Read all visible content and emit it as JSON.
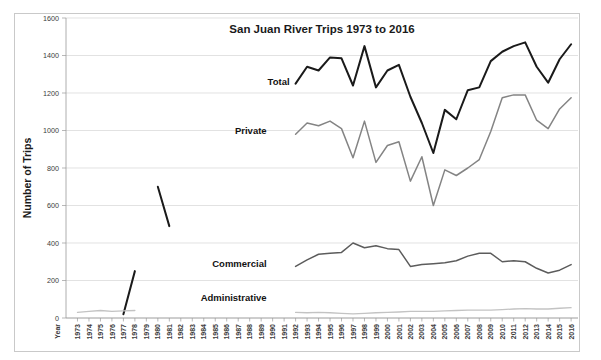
{
  "figure": {
    "title": "San Juan River Trips 1973 to 2016",
    "y_axis_title": "Number of Trips",
    "x_axis_corner_label": "Year"
  },
  "colors": {
    "total": "#1a1a1a",
    "private": "#848484",
    "commercial": "#5c5c5c",
    "administrative": "#c3c3c3",
    "grid": "#d6d6d6",
    "axis": "#9a9a9a",
    "frame": "#c9c9c9",
    "background": "#ffffff"
  },
  "series_labels": {
    "total": "Total",
    "private": "Private",
    "commercial": "Commercial",
    "administrative": "Administrative"
  },
  "chart_data": {
    "type": "line",
    "title": "San Juan River Trips 1973 to 2016",
    "xlabel": "Year",
    "ylabel": "Number of Trips",
    "ylim": [
      0,
      1600
    ],
    "ytick_labels": [
      "0",
      "200",
      "400",
      "600",
      "800",
      "1000",
      "1200",
      "1400",
      "1600"
    ],
    "yticks": [
      0,
      200,
      400,
      600,
      800,
      1000,
      1200,
      1400,
      1600
    ],
    "grid": true,
    "legend": "inline-labels",
    "categories": [
      "1973",
      "1974",
      "1975",
      "1976",
      "1977",
      "1978",
      "1979",
      "1980",
      "1981",
      "1982",
      "1983",
      "1984",
      "1985",
      "1986",
      "1987",
      "1988",
      "1989",
      "1990",
      "1991",
      "1992",
      "1993",
      "1994",
      "1995",
      "1996",
      "1997",
      "1998",
      "1999",
      "2000",
      "2001",
      "2002",
      "2003",
      "2004",
      "2005",
      "2006",
      "2007",
      "2008",
      "2009",
      "2010",
      "2011",
      "2012",
      "2013",
      "2014",
      "2015",
      "2016"
    ],
    "series": [
      {
        "name": "Total",
        "color": "#1a1a1a",
        "values": [
          null,
          null,
          null,
          null,
          20,
          250,
          null,
          700,
          490,
          null,
          null,
          null,
          null,
          null,
          null,
          null,
          null,
          null,
          null,
          1250,
          1340,
          1320,
          1390,
          1385,
          1240,
          1450,
          1230,
          1320,
          1350,
          1180,
          1040,
          880,
          1110,
          1060,
          1215,
          1230,
          1370,
          1420,
          1450,
          1470,
          1340,
          1255,
          1380,
          1460
        ]
      },
      {
        "name": "Private",
        "color": "#848484",
        "values": [
          null,
          null,
          null,
          null,
          null,
          null,
          null,
          null,
          null,
          null,
          null,
          null,
          null,
          null,
          null,
          null,
          null,
          null,
          null,
          980,
          1040,
          1025,
          1050,
          1010,
          855,
          1050,
          830,
          920,
          940,
          730,
          860,
          600,
          790,
          760,
          800,
          845,
          995,
          1175,
          1190,
          1190,
          1055,
          1010,
          1115,
          1175
        ]
      },
      {
        "name": "Commercial",
        "color": "#5c5c5c",
        "values": [
          null,
          null,
          null,
          null,
          null,
          null,
          null,
          null,
          null,
          null,
          null,
          null,
          null,
          null,
          null,
          null,
          null,
          null,
          null,
          275,
          310,
          340,
          345,
          350,
          400,
          375,
          385,
          370,
          365,
          275,
          285,
          290,
          295,
          305,
          330,
          345,
          345,
          300,
          305,
          300,
          265,
          240,
          255,
          285
        ]
      },
      {
        "name": "Administrative",
        "color": "#c3c3c3",
        "values": [
          30,
          35,
          40,
          35,
          38,
          40,
          null,
          null,
          null,
          null,
          null,
          null,
          null,
          null,
          null,
          null,
          null,
          null,
          null,
          30,
          28,
          30,
          28,
          25,
          22,
          25,
          28,
          30,
          32,
          35,
          35,
          35,
          38,
          40,
          42,
          42,
          42,
          45,
          48,
          50,
          48,
          48,
          52,
          55
        ]
      }
    ],
    "annotations": [
      {
        "text": "Total",
        "x_year": 1992,
        "y_value": 1260
      },
      {
        "text": "Private",
        "x_year": 1990,
        "y_value": 1000
      },
      {
        "text": "Commercial",
        "x_year": 1990,
        "y_value": 290
      },
      {
        "text": "Administrative",
        "x_year": 1990,
        "y_value": 110
      }
    ]
  }
}
